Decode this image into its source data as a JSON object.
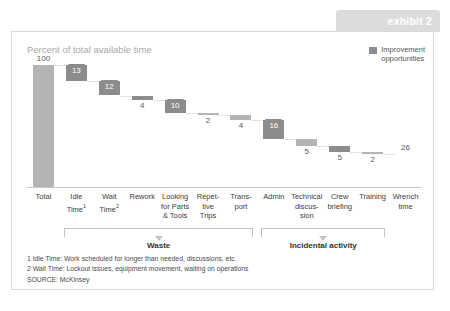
{
  "exhibit": {
    "tab_label": "exhibit 2"
  },
  "chart": {
    "title": "Percent of total available time",
    "legend": {
      "swatch_color": "#8c8c8c",
      "label": "Improvement\nopportunities"
    },
    "brackets": [
      {
        "label": "Waste"
      },
      {
        "label": "Incidental activity"
      }
    ],
    "footnotes": [
      "1 Idle Time:  Work scheduled for longer than needed, discussions, etc.",
      "2 Wait Time:  Lockout issues,  equipment movement, waiting on operations"
    ],
    "source": "SOURCE: McKinsey"
  },
  "chart_data": {
    "type": "bar",
    "chart_style": "waterfall",
    "title": "Percent of total available time",
    "xlabel": "",
    "ylabel": "Percent of total available time",
    "ylim": [
      0,
      100
    ],
    "grid": false,
    "legend_position": "top-right",
    "legend_entries": [
      "Improvement opportunities"
    ],
    "categories": [
      "Total",
      "Idle Time¹",
      "Wait Time²",
      "Rework",
      "Looking for Parts & Tools",
      "Repetitive Trips",
      "Transport",
      "Admin",
      "Technical discussion",
      "Crew briefing",
      "Training",
      "Wrench time"
    ],
    "category_lines": [
      [
        "Total"
      ],
      [
        "Idle",
        "Time¹"
      ],
      [
        "Wait",
        "Time²"
      ],
      [
        "Rework"
      ],
      [
        "Looking",
        "for Parts",
        "& Tools"
      ],
      [
        "Repet-",
        "tive",
        "Trips"
      ],
      [
        "Trans-",
        "port"
      ],
      [
        "Admin"
      ],
      [
        "Technical",
        "discus-",
        "sion"
      ],
      [
        "Crew",
        "briefing"
      ],
      [
        "Training"
      ],
      [
        "Wrench",
        "time"
      ]
    ],
    "values": [
      100,
      13,
      12,
      4,
      10,
      2,
      4,
      16,
      5,
      5,
      2,
      26
    ],
    "value_labels": [
      "100",
      "13",
      "12",
      "4",
      "10",
      "2",
      "4",
      "16",
      "5",
      "5",
      "2",
      "26"
    ],
    "bar_kinds": [
      "total",
      "decrement",
      "decrement",
      "decrement",
      "decrement",
      "decrement",
      "decrement",
      "decrement",
      "decrement",
      "decrement",
      "decrement",
      "total"
    ],
    "highlighted": [
      false,
      true,
      true,
      true,
      true,
      false,
      false,
      true,
      false,
      true,
      false,
      false
    ],
    "label_boxed": [
      false,
      true,
      true,
      false,
      true,
      false,
      false,
      true,
      false,
      false,
      false,
      false
    ],
    "cumulative_start": [
      0,
      100,
      87,
      75,
      71,
      61,
      59,
      55,
      39,
      34,
      29,
      0
    ],
    "cumulative_end": [
      100,
      87,
      75,
      71,
      61,
      59,
      55,
      39,
      34,
      29,
      27,
      26
    ],
    "group_spans": [
      {
        "label": "Waste",
        "from": "Idle Time¹",
        "to": "Transport"
      },
      {
        "label": "Incidental activity",
        "from": "Admin",
        "to": "Training"
      }
    ]
  }
}
